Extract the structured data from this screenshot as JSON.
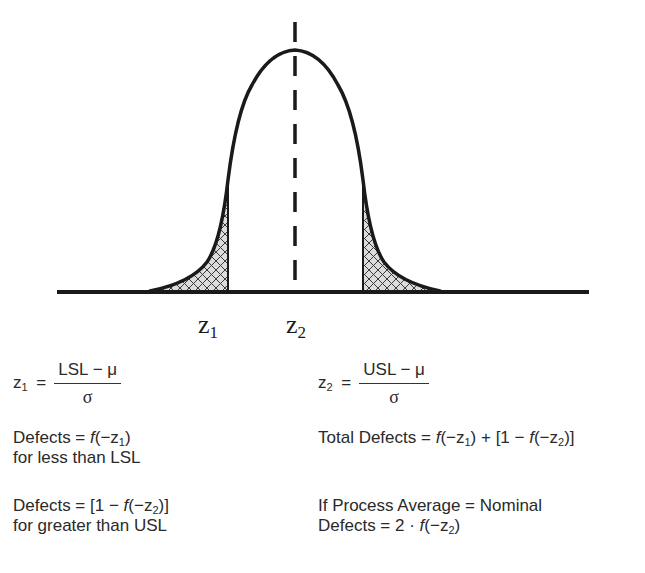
{
  "diagram": {
    "type": "normal-distribution-with-spec-limits",
    "curve": {
      "mean_x": 295,
      "peak_y": 50,
      "baseline_y": 292,
      "baseline_x_range": [
        57,
        589
      ],
      "left_spec_limit_x": 228,
      "right_spec_limit_x": 363,
      "tail_fill": "crosshatch",
      "center_line": "dashed"
    },
    "labels": {
      "z1_base": "z",
      "z1_sub": "1",
      "z2_base": "z",
      "z2_sub": "2"
    },
    "colors": {
      "stroke": "#1a1a1a",
      "hatch_fill": "#dcdcdc",
      "background": "#ffffff"
    }
  },
  "formulas": {
    "z1": {
      "lhs_var": "z",
      "lhs_sub": "1",
      "equals": "=",
      "numerator": "LSL − μ",
      "denominator": "σ"
    },
    "z2": {
      "lhs_var": "z",
      "lhs_sub": "2",
      "equals": "=",
      "numerator": "USL − μ",
      "denominator": "σ"
    }
  },
  "notes": {
    "defects_lsl": {
      "line1_prefix": "Defects = ",
      "line1_f": "f",
      "line1_arg_open": "(−z",
      "line1_arg_sub": "1",
      "line1_arg_close": ")",
      "line2": "for less than LSL"
    },
    "defects_usl": {
      "line1_prefix": "Defects = [1 − ",
      "line1_f": "f",
      "line1_arg_open": "(−z",
      "line1_arg_sub": "2",
      "line1_arg_close": ")]",
      "line2": "for greater than USL"
    },
    "total_defects": {
      "prefix": "Total Defects = ",
      "f1": "f",
      "arg1_open": "(−z",
      "arg1_sub": "1",
      "arg1_close": ") + [1 − ",
      "f2": "f",
      "arg2_open": "(−z",
      "arg2_sub": "2",
      "arg2_close": ")]"
    },
    "nominal": {
      "line1": "If Process Average = Nominal",
      "line2_prefix": "Defects = 2 · ",
      "line2_f": "f",
      "line2_arg_open": "(−z",
      "line2_arg_sub": "2",
      "line2_arg_close": ")"
    }
  }
}
